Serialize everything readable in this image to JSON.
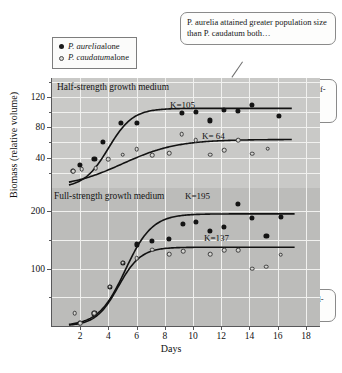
{
  "legend": {
    "items": [
      {
        "marker": "filled-circle",
        "species": "P. aurelia",
        "suffix": " alone"
      },
      {
        "marker": "open-circle",
        "species": "P. caudatum",
        "suffix": " alone"
      }
    ]
  },
  "callouts": {
    "main": "P. aurelia attained greater population size than P. caudatum both…",
    "half": "…when grown in half-strength growth medium…",
    "full": "…and when grown in full-strength growth medium."
  },
  "colors": {
    "panel_top": "#c9c9c7",
    "panel_bottom": "#bcbcba",
    "gridline": "#f1f1ef",
    "axis": "#58585a",
    "curve": "#121212",
    "filled_marker": "#141414",
    "open_marker": "#d5d5d2",
    "callout_border": "#8a8a8a"
  },
  "chart_data": {
    "type": "scatter",
    "title": "",
    "xlabel": "Days",
    "ylabel": "Biomass (relative volume)",
    "xlim": [
      0,
      19
    ],
    "xticks": [
      2,
      4,
      6,
      8,
      10,
      12,
      14,
      16,
      18
    ],
    "grid": true,
    "panels": [
      {
        "name": "half-strength",
        "label": "Half-strength growth medium",
        "ylim": [
          0,
          145
        ],
        "yticks": [
          40,
          80,
          120
        ],
        "minor_yticks": [
          20,
          60,
          100,
          140
        ],
        "series": [
          {
            "name": "P. aurelia alone",
            "marker": "filled-circle",
            "K": 105,
            "K_label": "K=105",
            "points": [
              {
                "x": 1.5,
                "y": 22
              },
              {
                "x": 2.0,
                "y": 30
              },
              {
                "x": 3.0,
                "y": 38
              },
              {
                "x": 3.6,
                "y": 61
              },
              {
                "x": 4.9,
                "y": 86
              },
              {
                "x": 6.0,
                "y": 86
              },
              {
                "x": 9.2,
                "y": 99
              },
              {
                "x": 10.2,
                "y": 100
              },
              {
                "x": 11.2,
                "y": 89
              },
              {
                "x": 12.2,
                "y": 103
              },
              {
                "x": 13.2,
                "y": 102
              },
              {
                "x": 14.2,
                "y": 109
              },
              {
                "x": 16.1,
                "y": 95
              }
            ]
          },
          {
            "name": "P. caudatum alone",
            "marker": "open-circle",
            "K": 64,
            "K_label": "K= 64",
            "points": [
              {
                "x": 1.5,
                "y": 22
              },
              {
                "x": 2.1,
                "y": 25
              },
              {
                "x": 3.1,
                "y": 26
              },
              {
                "x": 4.0,
                "y": 38
              },
              {
                "x": 5.0,
                "y": 44
              },
              {
                "x": 6.0,
                "y": 51
              },
              {
                "x": 7.1,
                "y": 43
              },
              {
                "x": 8.3,
                "y": 46
              },
              {
                "x": 9.2,
                "y": 71
              },
              {
                "x": 10.2,
                "y": 63
              },
              {
                "x": 11.2,
                "y": 44
              },
              {
                "x": 12.2,
                "y": 50
              },
              {
                "x": 13.2,
                "y": 63
              },
              {
                "x": 14.2,
                "y": 45
              },
              {
                "x": 15.3,
                "y": 52
              }
            ]
          }
        ]
      },
      {
        "name": "full-strength",
        "label": "Full-strength growth medium",
        "ylim": [
          0,
          240
        ],
        "yticks": [
          100,
          200
        ],
        "minor_yticks": [
          50,
          150
        ],
        "series": [
          {
            "name": "P. aurelia alone",
            "marker": "filled-circle",
            "K": 195,
            "K_label": "K=195",
            "points": [
              {
                "x": 2.0,
                "y": 5
              },
              {
                "x": 3.0,
                "y": 22
              },
              {
                "x": 4.1,
                "y": 68
              },
              {
                "x": 5.0,
                "y": 110
              },
              {
                "x": 6.0,
                "y": 142
              },
              {
                "x": 7.1,
                "y": 148
              },
              {
                "x": 8.3,
                "y": 152
              },
              {
                "x": 9.3,
                "y": 178
              },
              {
                "x": 10.2,
                "y": 181
              },
              {
                "x": 11.2,
                "y": 166
              },
              {
                "x": 12.2,
                "y": 173
              },
              {
                "x": 13.2,
                "y": 212
              },
              {
                "x": 14.2,
                "y": 188
              },
              {
                "x": 15.2,
                "y": 156
              },
              {
                "x": 16.2,
                "y": 190
              }
            ]
          },
          {
            "name": "P. caudatum alone",
            "marker": "open-circle",
            "K": 137,
            "K_label": "K=137",
            "points": [
              {
                "x": 1.6,
                "y": 22
              },
              {
                "x": 2.0,
                "y": 5
              },
              {
                "x": 3.0,
                "y": 22
              },
              {
                "x": 4.1,
                "y": 68
              },
              {
                "x": 5.0,
                "y": 110
              },
              {
                "x": 6.0,
                "y": 118
              },
              {
                "x": 7.1,
                "y": 133
              },
              {
                "x": 8.3,
                "y": 125
              },
              {
                "x": 9.3,
                "y": 130
              },
              {
                "x": 11.2,
                "y": 125
              },
              {
                "x": 12.2,
                "y": 132
              },
              {
                "x": 13.2,
                "y": 132
              },
              {
                "x": 14.2,
                "y": 100
              },
              {
                "x": 15.2,
                "y": 103
              },
              {
                "x": 16.2,
                "y": 124
              }
            ]
          }
        ]
      }
    ]
  }
}
